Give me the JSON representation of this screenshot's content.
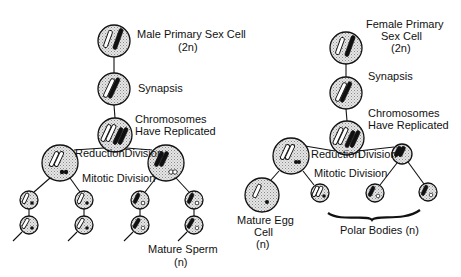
{
  "male": {
    "title": "Male Primary Sex Cell",
    "ploidy_2n": "(2n)",
    "synapsis": "Synapsis",
    "replicated_line1": "Chromosomes",
    "replicated_line2": "Have Replicated",
    "reduction": "ReductionDivision",
    "mitotic": "Mitotic Division",
    "result_line1": "Mature Sperm",
    "result_line2": "(n)"
  },
  "female": {
    "title_line1": "Female Primary",
    "title_line2": "Sex Cell",
    "ploidy_2n": "(2n)",
    "synapsis": "Synapsis",
    "replicated_line1": "Chromosomes",
    "replicated_line2": "Have Replicated",
    "reduction_a": "Reduction",
    "reduction_b": "Division",
    "mitotic": "Mitotic Division",
    "egg_line1": "Mature Egg",
    "egg_line2": "Cell",
    "egg_line3": "(n)",
    "polar": "Polar Bodies (n)"
  },
  "colors": {
    "ink": "#111111",
    "cell_fill": "#d9d9d9",
    "background": "#ffffff"
  }
}
